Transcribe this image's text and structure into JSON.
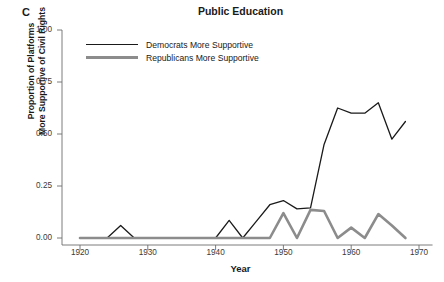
{
  "panel": {
    "label": "C"
  },
  "chart_data": {
    "type": "line",
    "title": "Public Education",
    "xlabel": "Year",
    "ylabel": "Proportion of Platforms\nMore Supportive of Civil Rights",
    "ylabel_line1": "Proportion of Platforms",
    "ylabel_line2": "More Supportive of Civil Rights",
    "xlim": [
      1918,
      1972
    ],
    "ylim": [
      0.0,
      1.0
    ],
    "xticks": [
      1920,
      1930,
      1940,
      1950,
      1960,
      1970
    ],
    "xtick_labels": [
      "1920",
      "1930",
      "1940",
      "1950",
      "1960",
      "1970"
    ],
    "yticks": [
      0.0,
      0.25,
      0.5,
      0.75,
      1.0
    ],
    "ytick_labels": [
      "0.00",
      "0.25",
      "0.50",
      "0.75",
      "1.00"
    ],
    "grid": false,
    "legend_position": "top-left-inside",
    "series": [
      {
        "name": "Democrats More Supportive",
        "color": "#1a1a1a",
        "line_width": 1.3,
        "x": [
          1920,
          1922,
          1924,
          1926,
          1928,
          1930,
          1932,
          1934,
          1936,
          1938,
          1940,
          1942,
          1944,
          1946,
          1948,
          1950,
          1952,
          1954,
          1956,
          1958,
          1960,
          1962,
          1964,
          1966,
          1968
        ],
        "values": [
          0.0,
          0.0,
          0.0,
          0.06,
          0.0,
          0.0,
          0.0,
          0.0,
          0.0,
          0.0,
          0.0,
          0.085,
          0.0,
          0.08,
          0.16,
          0.18,
          0.14,
          0.145,
          0.45,
          0.625,
          0.6,
          0.6,
          0.65,
          0.475,
          0.56
        ]
      },
      {
        "name": "Republicans More Supportive",
        "color": "#8c8c8c",
        "line_width": 2.6,
        "x": [
          1920,
          1922,
          1924,
          1926,
          1928,
          1930,
          1932,
          1934,
          1936,
          1938,
          1940,
          1942,
          1944,
          1946,
          1948,
          1950,
          1952,
          1954,
          1956,
          1958,
          1960,
          1962,
          1964,
          1966,
          1968
        ],
        "values": [
          0.0,
          0.0,
          0.0,
          0.0,
          0.0,
          0.0,
          0.0,
          0.0,
          0.0,
          0.0,
          0.0,
          0.0,
          0.0,
          0.0,
          0.0,
          0.12,
          0.0,
          0.135,
          0.13,
          0.0,
          0.05,
          0.0,
          0.115,
          0.06,
          0.0
        ]
      }
    ]
  },
  "legend": {
    "items": [
      {
        "label": "Democrats More Supportive",
        "color": "#1a1a1a",
        "width": 1.3
      },
      {
        "label": "Republicans More Supportive",
        "color": "#8c8c8c",
        "width": 2.8
      }
    ]
  },
  "axis": {
    "line_color": "#6e6e6e",
    "tick_color": "#6e6e6e"
  }
}
